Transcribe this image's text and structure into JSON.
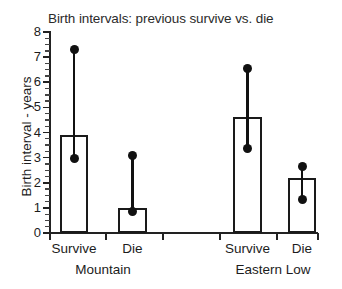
{
  "chart_data": {
    "type": "bar",
    "title": "Birth intervals: previous survive vs. die",
    "xlabel": "",
    "ylabel": "Birth interval - years",
    "ylim": [
      0,
      8
    ],
    "ytick_labels": [
      "0",
      "1",
      "2",
      "3",
      "4",
      "5",
      "6",
      "7",
      "8"
    ],
    "yticks": [
      0,
      1,
      2,
      3,
      4,
      5,
      6,
      7,
      8
    ],
    "minor_ticks": true,
    "grid": false,
    "legend": "none",
    "categories": [
      "Survive",
      "Die",
      "Survive",
      "Die"
    ],
    "groups": [
      "Mountain",
      "Eastern Low"
    ],
    "group_membership": [
      0,
      0,
      1,
      1
    ],
    "values": [
      3.9,
      1.0,
      4.6,
      2.2
    ],
    "error_high": [
      7.3,
      3.1,
      6.55,
      2.65
    ],
    "error_low": [
      2.95,
      0.85,
      3.35,
      1.35
    ],
    "series": [
      {
        "name": "Birth interval",
        "values": [
          3.9,
          1.0,
          4.6,
          2.2
        ]
      }
    ],
    "points": [
      {
        "group": "Mountain",
        "category": "Survive",
        "value": 3.9,
        "upper": 7.3,
        "lower": 2.95
      },
      {
        "group": "Mountain",
        "category": "Die",
        "value": 1.0,
        "upper": 3.1,
        "lower": 0.85
      },
      {
        "group": "Eastern Low",
        "category": "Survive",
        "value": 4.6,
        "upper": 6.55,
        "lower": 3.35
      },
      {
        "group": "Eastern Low",
        "category": "Die",
        "value": 2.2,
        "upper": 2.65,
        "lower": 1.35
      }
    ],
    "colors": {
      "bar_fill": "#ffffff",
      "bar_edge": "#1a1a1a",
      "error": "#111111",
      "axis": "#222222",
      "text": "#1c1c1c"
    }
  }
}
